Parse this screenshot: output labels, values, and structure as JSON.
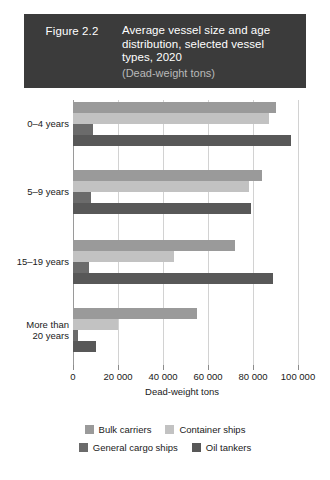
{
  "header": {
    "figure_number": "Figure 2.2",
    "title": "Average vessel size and age distribution, selected vessel types, 2020",
    "subtitle": "(Dead-weight tons)",
    "background_color": "#3b3b3b",
    "text_color": "#ffffff"
  },
  "legend": {
    "items": [
      {
        "label": "Bulk carriers",
        "color": "#9a9a9a"
      },
      {
        "label": "Container ships",
        "color": "#c2c2c2"
      },
      {
        "label": "General cargo ships",
        "color": "#6b6b6b"
      },
      {
        "label": "Oil tankers",
        "color": "#585858"
      }
    ]
  },
  "chart_data": {
    "type": "bar",
    "orientation": "horizontal",
    "title": "Average vessel size and age distribution, selected vessel types, 2020",
    "subtitle": "(Dead-weight tons)",
    "xlabel": "Dead-weight tons",
    "ylabel": "",
    "xlim": [
      0,
      100000
    ],
    "xticks": [
      0,
      20000,
      40000,
      60000,
      80000,
      100000
    ],
    "xtick_labels": [
      "0",
      "20 000",
      "40 000",
      "60 000",
      "80 000",
      "100 000"
    ],
    "grid": true,
    "legend_position": "bottom",
    "categories": [
      "0–4 years",
      "5–9 years",
      "15–19 years",
      "More than 20 years"
    ],
    "category_labels_display": [
      "0–4 years",
      "5–9 years",
      "15–19 years",
      "More than\n20 years"
    ],
    "series": [
      {
        "name": "Bulk carriers",
        "color": "#9a9a9a",
        "values": [
          90000,
          84000,
          72000,
          55000
        ]
      },
      {
        "name": "Container ships",
        "color": "#c2c2c2",
        "values": [
          87000,
          78000,
          45000,
          20000
        ]
      },
      {
        "name": "General cargo ships",
        "color": "#6b6b6b",
        "values": [
          9000,
          8000,
          7000,
          2000
        ]
      },
      {
        "name": "Oil tankers",
        "color": "#585858",
        "values": [
          97000,
          79000,
          89000,
          10000
        ]
      }
    ]
  }
}
